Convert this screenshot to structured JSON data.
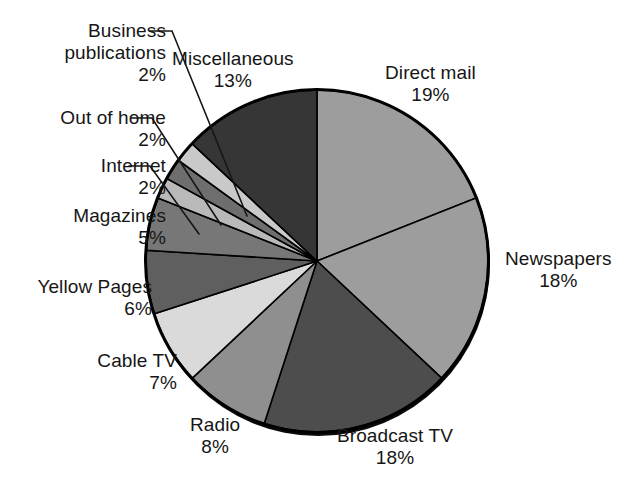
{
  "chart_data": {
    "type": "pie",
    "title": "",
    "units": "percent",
    "total": 100,
    "start_angle_deg": 0,
    "direction": "clockwise",
    "categories": [
      "Direct mail",
      "Newspapers",
      "Broadcast TV",
      "Radio",
      "Cable TV",
      "Yellow Pages",
      "Magazines",
      "Internet",
      "Out of home",
      "Business publications",
      "Miscellaneous"
    ],
    "values": [
      19,
      18,
      18,
      8,
      7,
      6,
      5,
      2,
      2,
      2,
      13
    ],
    "slices": [
      {
        "label": "Direct mail",
        "value": 19,
        "percent_text": "19%",
        "color": "#9d9d9d",
        "leader": false
      },
      {
        "label": "Newspapers",
        "value": 18,
        "percent_text": "18%",
        "color": "#9d9d9d",
        "leader": false
      },
      {
        "label": "Broadcast TV",
        "value": 18,
        "percent_text": "18%",
        "color": "#4d4d4d",
        "leader": false
      },
      {
        "label": "Radio",
        "value": 8,
        "percent_text": "8%",
        "color": "#8f8f8f",
        "leader": false
      },
      {
        "label": "Cable TV",
        "value": 7,
        "percent_text": "7%",
        "color": "#dadada",
        "leader": false
      },
      {
        "label": "Yellow Pages",
        "value": 6,
        "percent_text": "6%",
        "color": "#5f5f5f",
        "leader": false
      },
      {
        "label": "Magazines",
        "value": 5,
        "percent_text": "5%",
        "color": "#777777",
        "leader": false
      },
      {
        "label": "Internet",
        "value": 2,
        "percent_text": "2%",
        "color": "#b9b9b9",
        "leader": true
      },
      {
        "label": "Out of home",
        "value": 2,
        "percent_text": "2%",
        "color": "#6e6e6e",
        "leader": true
      },
      {
        "label": "Business publications",
        "value": 2,
        "percent_text": "2%",
        "color": "#c9c9c9",
        "leader": true
      },
      {
        "label": "Miscellaneous",
        "value": 13,
        "percent_text": "13%",
        "color": "#363636",
        "leader": false
      }
    ],
    "legend": "none",
    "grid": false,
    "outline_color": "#000000",
    "shadow_color": "#0a0a0a"
  },
  "labels": {
    "business_publications": {
      "line1": "Business",
      "line2": "publications",
      "pct": "2%"
    },
    "out_of_home": {
      "line1": "Out of home",
      "pct": "2%"
    },
    "internet": {
      "line1": "Internet",
      "pct": "2%"
    },
    "magazines": {
      "line1": "Magazines",
      "pct": "5%"
    },
    "yellow_pages": {
      "line1": "Yellow Pages",
      "pct": "6%"
    },
    "cable_tv": {
      "line1": "Cable TV",
      "pct": "7%"
    },
    "radio": {
      "line1": "Radio",
      "pct": "8%"
    },
    "broadcast_tv": {
      "line1": "Broadcast TV",
      "pct": "18%"
    },
    "newspapers": {
      "line1": "Newspapers",
      "pct": "18%"
    },
    "direct_mail": {
      "line1": "Direct mail",
      "pct": "19%"
    },
    "miscellaneous": {
      "line1": "Miscellaneous",
      "pct": "13%"
    }
  }
}
